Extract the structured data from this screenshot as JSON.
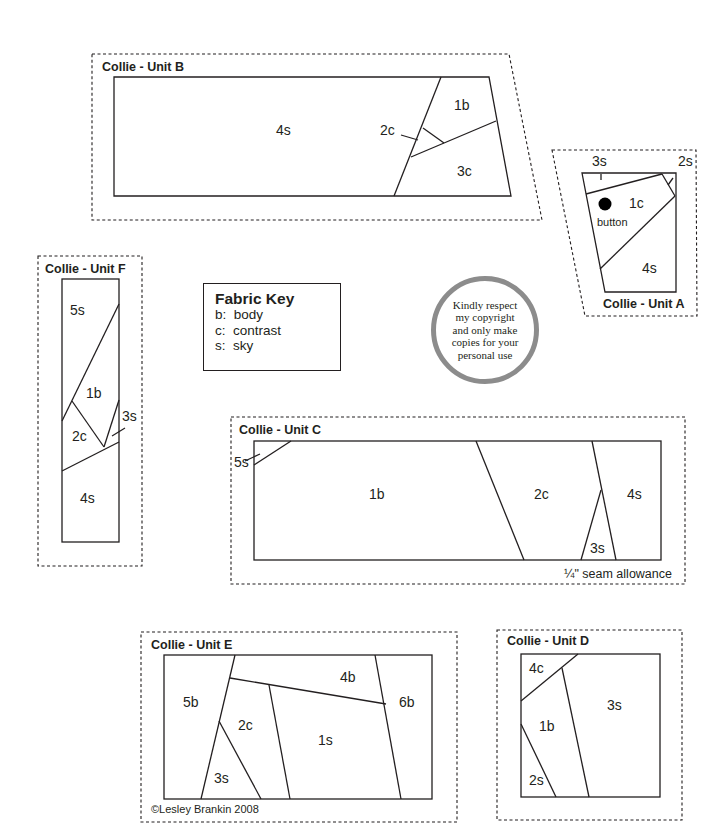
{
  "units": {
    "B": {
      "title": "Collie - Unit B",
      "pieces": [
        "4s",
        "2c",
        "1b",
        "3c"
      ]
    },
    "A": {
      "title": "Collie - Unit A",
      "pieces": [
        "3s",
        "2s",
        "1c",
        "4s"
      ],
      "button_label": "button"
    },
    "F": {
      "title": "Collie - Unit F",
      "pieces": [
        "5s",
        "1b",
        "2c",
        "3s",
        "4s"
      ]
    },
    "C": {
      "title": "Collie - Unit C",
      "pieces": [
        "5s",
        "1b",
        "2c",
        "4s",
        "3s"
      ],
      "note": "¼\" seam allowance"
    },
    "E": {
      "title": "Collie - Unit E",
      "pieces": [
        "5b",
        "4b",
        "6b",
        "2c",
        "1s",
        "3s"
      ],
      "copyright": "©Lesley Brankin 2008"
    },
    "D": {
      "title": "Collie - Unit D",
      "pieces": [
        "4c",
        "3s",
        "1b",
        "2s"
      ]
    }
  },
  "fabric_key": {
    "title": "Fabric Key",
    "items": [
      "b:  body",
      "c:  contrast",
      "s:  sky"
    ]
  },
  "copyright_stamp": {
    "lines": [
      "Kindly respect",
      "my copyright",
      "and only make",
      "copies for your",
      "personal use"
    ],
    "ring_color": "#8c8c8c"
  },
  "colors": {
    "line": "#231f20",
    "background": "#ffffff"
  }
}
